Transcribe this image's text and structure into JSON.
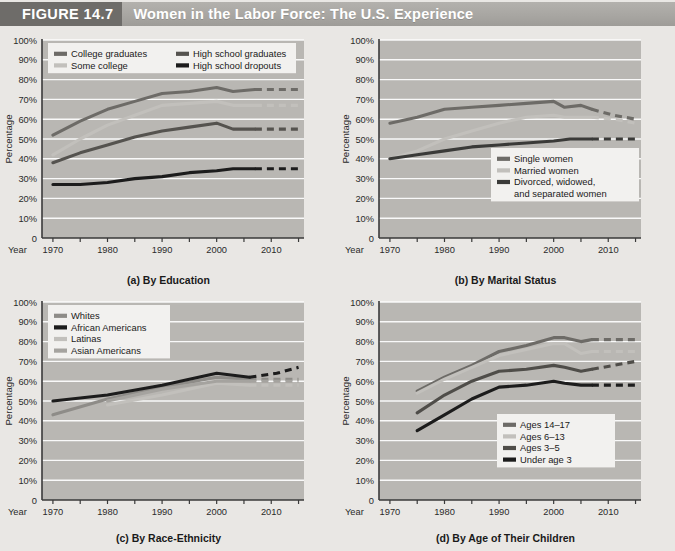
{
  "header": {
    "figure_number": "FIGURE 14.7",
    "title": "Women in the Labor Force: The U.S. Experience",
    "band_color": "#a8a6a2",
    "number_block_color": "#6e6c69"
  },
  "axis": {
    "ylabel": "Percentage",
    "year_label": "Year",
    "yticks": [
      "100%",
      "90%",
      "80%",
      "70%",
      "60%",
      "50%",
      "40%",
      "30%",
      "20%",
      "10%",
      "0"
    ],
    "ytick_values": [
      100,
      90,
      80,
      70,
      60,
      50,
      40,
      30,
      20,
      10,
      0
    ],
    "xticks": [
      "1970",
      "1980",
      "1990",
      "2000",
      "2010"
    ],
    "xtick_values": [
      1970,
      1980,
      1990,
      2000,
      2010
    ],
    "xlim": [
      1968,
      2016
    ],
    "ylim": [
      0,
      100
    ],
    "grid": "horizontal-white"
  },
  "colors": {
    "plot_background": "#b9b7b3",
    "page_background": "#e9e7e4",
    "gridline": "#ffffff",
    "axis_line": "#3a3a3a",
    "dark": "#1c1c1c",
    "mid_dark": "#4f4f4f",
    "mid": "#8c8a86",
    "light": "#c9c7c3"
  },
  "chart_data": [
    {
      "id": "a",
      "type": "line",
      "title": "(a) By Education",
      "xlabel": "Year",
      "ylabel": "Percentage",
      "xlim": [
        1968,
        2016
      ],
      "ylim": [
        0,
        100
      ],
      "grid": true,
      "legend_position": "top-inside",
      "projection_starts": 2007,
      "series": [
        {
          "name": "College graduates",
          "color": "#6d6b67",
          "x": [
            1970,
            1975,
            1980,
            1985,
            1990,
            1995,
            2000,
            2003,
            2007
          ],
          "values": [
            52,
            59,
            65,
            69,
            73,
            74,
            76,
            74,
            75
          ],
          "projection_x": [
            2007,
            2015
          ],
          "projection_values": [
            75,
            75
          ]
        },
        {
          "name": "Some college",
          "color": "#c2c0bc",
          "x": [
            1970,
            1975,
            1980,
            1985,
            1990,
            1995,
            2000,
            2003,
            2007
          ],
          "values": [
            42,
            50,
            57,
            62,
            67,
            68,
            69,
            67,
            67
          ],
          "projection_x": [
            2007,
            2015
          ],
          "projection_values": [
            67,
            67
          ]
        },
        {
          "name": "High school graduates",
          "color": "#55534f",
          "x": [
            1970,
            1975,
            1980,
            1985,
            1990,
            1995,
            2000,
            2003,
            2007
          ],
          "values": [
            38,
            43,
            47,
            51,
            54,
            56,
            58,
            55,
            55
          ],
          "projection_x": [
            2007,
            2015
          ],
          "projection_values": [
            55,
            55
          ]
        },
        {
          "name": "High school dropouts",
          "color": "#1c1c1c",
          "x": [
            1970,
            1975,
            1980,
            1985,
            1990,
            1995,
            2000,
            2003,
            2007
          ],
          "values": [
            27,
            27,
            28,
            30,
            31,
            33,
            34,
            35,
            35
          ],
          "projection_x": [
            2007,
            2015
          ],
          "projection_values": [
            35,
            35
          ]
        }
      ]
    },
    {
      "id": "b",
      "type": "line",
      "title": "(b) By Marital Status",
      "xlabel": "Year",
      "ylabel": "Percentage",
      "xlim": [
        1968,
        2016
      ],
      "ylim": [
        0,
        100
      ],
      "grid": true,
      "legend_position": "bottom-right-inside",
      "projection_starts": 2007,
      "series": [
        {
          "name": "Single women",
          "color": "#6d6b67",
          "x": [
            1970,
            1975,
            1980,
            1985,
            1990,
            1995,
            2000,
            2002,
            2005,
            2007
          ],
          "values": [
            58,
            61,
            65,
            66,
            67,
            68,
            69,
            66,
            67,
            65
          ],
          "projection_x": [
            2007,
            2011,
            2015
          ],
          "projection_values": [
            65,
            62,
            60
          ]
        },
        {
          "name": "Married women",
          "color": "#c2c0bc",
          "x": [
            1970,
            1975,
            1980,
            1985,
            1990,
            1995,
            2000,
            2002,
            2005,
            2007
          ],
          "values": [
            40,
            44,
            50,
            54,
            58,
            61,
            62,
            61,
            61,
            61
          ],
          "projection_x": [
            2007,
            2011,
            2015
          ],
          "projection_values": [
            61,
            60,
            58
          ]
        },
        {
          "name": "Divorced, widowed, and separated women",
          "color": "#3a3a38",
          "x": [
            1970,
            1975,
            1980,
            1985,
            1990,
            1995,
            2000,
            2003,
            2007
          ],
          "values": [
            40,
            42,
            44,
            46,
            47,
            48,
            49,
            50,
            50
          ],
          "projection_x": [
            2007,
            2015
          ],
          "projection_values": [
            50,
            50
          ]
        }
      ]
    },
    {
      "id": "c",
      "type": "line",
      "title": "(c) By Race-Ethnicity",
      "xlabel": "Year",
      "ylabel": "Percentage",
      "xlim": [
        1968,
        2016
      ],
      "ylim": [
        0,
        100
      ],
      "grid": true,
      "legend_position": "top-left-inside",
      "projection_starts": 2007,
      "series": [
        {
          "name": "Whites",
          "color": "#8e8c88",
          "x": [
            1970,
            1980,
            1990,
            2000,
            2006
          ],
          "values": [
            43,
            51,
            57,
            62,
            61
          ],
          "projection_x": [
            2006,
            2011,
            2015
          ],
          "projection_values": [
            61,
            61,
            61
          ]
        },
        {
          "name": "African Americans",
          "color": "#1c1c1c",
          "x": [
            1970,
            1980,
            1990,
            2000,
            2006
          ],
          "values": [
            50,
            53,
            58,
            64,
            62
          ],
          "projection_x": [
            2006,
            2011,
            2015
          ],
          "projection_values": [
            62,
            64,
            67
          ]
        },
        {
          "name": "Latinas",
          "color": "#c2c0bc",
          "x": [
            1980,
            1990,
            2000,
            2006
          ],
          "values": [
            48,
            53,
            59,
            58
          ],
          "projection_x": [
            2006,
            2011,
            2015
          ],
          "projection_values": [
            58,
            58,
            58
          ]
        },
        {
          "name": "Asian Americans",
          "color": "#a5a39f",
          "x": [
            1980,
            1990,
            2000,
            2006
          ],
          "values": [
            50,
            56,
            60,
            60
          ],
          "projection_x": [
            2006,
            2011,
            2015
          ],
          "projection_values": [
            60,
            60,
            60
          ]
        }
      ]
    },
    {
      "id": "d",
      "type": "line",
      "title": "(d) By Age of Their Children",
      "xlabel": "Year",
      "ylabel": "Percentage",
      "xlim": [
        1968,
        2016
      ],
      "ylim": [
        0,
        100
      ],
      "grid": true,
      "legend_position": "bottom-right-inside",
      "projection_starts": 2007,
      "series": [
        {
          "name": "Ages 14–17",
          "color": "#6d6b67",
          "x": [
            1975,
            1980,
            1985,
            1990,
            1995,
            2000,
            2002,
            2005,
            2007
          ],
          "values": [
            55,
            62,
            68,
            75,
            78,
            82,
            82,
            80,
            81
          ],
          "projection_x": [
            2007,
            2015
          ],
          "projection_values": [
            81,
            81
          ]
        },
        {
          "name": "Ages 6–13",
          "color": "#c2c0bc",
          "x": [
            1975,
            1980,
            1985,
            1990,
            1995,
            2000,
            2002,
            2005,
            2007
          ],
          "values": [
            54,
            61,
            67,
            73,
            76,
            79,
            79,
            74,
            75
          ],
          "projection_x": [
            2007,
            2015
          ],
          "projection_values": [
            75,
            75
          ]
        },
        {
          "name": "Ages 3–5",
          "color": "#4f4d49",
          "x": [
            1975,
            1980,
            1985,
            1990,
            1995,
            2000,
            2002,
            2005,
            2007
          ],
          "values": [
            44,
            53,
            60,
            65,
            66,
            68,
            67,
            65,
            66
          ],
          "projection_x": [
            2007,
            2015
          ],
          "projection_values": [
            66,
            70
          ]
        },
        {
          "name": "Under age 3",
          "color": "#1c1c1c",
          "x": [
            1975,
            1980,
            1985,
            1990,
            1995,
            2000,
            2002,
            2005,
            2007
          ],
          "values": [
            35,
            43,
            51,
            57,
            58,
            60,
            59,
            58,
            58
          ],
          "projection_x": [
            2007,
            2015
          ],
          "projection_values": [
            58,
            58
          ]
        }
      ]
    }
  ]
}
